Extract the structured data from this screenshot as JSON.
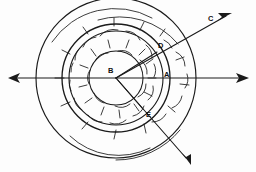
{
  "figure": {
    "background_color": "#fdfdfd",
    "ink_color": "#1a1a1a",
    "width": 256,
    "height": 172,
    "center": {
      "name": "B",
      "x": 116,
      "y": 78
    },
    "labels": [
      {
        "id": "B",
        "text": "B",
        "x": 110,
        "y": 73,
        "role": "center-of-circles"
      },
      {
        "id": "A",
        "text": "A",
        "x": 166,
        "y": 76,
        "role": "point-on-circle-right"
      },
      {
        "id": "C",
        "text": "C",
        "x": 209,
        "y": 20,
        "role": "ray-endpoint-upper-right"
      },
      {
        "id": "D",
        "text": "D",
        "x": 160,
        "y": 47,
        "role": "point-on-circle-upper-right"
      },
      {
        "id": "E",
        "text": "E",
        "x": 148,
        "y": 114,
        "role": "point-on-circle-lower-right"
      }
    ],
    "circles": [
      {
        "id": "outer",
        "cx": 116,
        "cy": 78,
        "r": 80,
        "class": "circle-outer"
      },
      {
        "id": "mid",
        "cx": 116,
        "cy": 78,
        "r": 54,
        "class": "circle-mid"
      },
      {
        "id": "inner",
        "cx": 116,
        "cy": 78,
        "r": 47,
        "class": "circle-inner"
      },
      {
        "id": "small",
        "cx": 116,
        "cy": 78,
        "r": 27,
        "class": "circle-small"
      }
    ],
    "rays": [
      {
        "id": "axis-left",
        "x1": 116,
        "y1": 78,
        "x2": 10,
        "y2": 78,
        "arrow": true,
        "label": ""
      },
      {
        "id": "axis-right",
        "x1": 116,
        "y1": 78,
        "x2": 246,
        "y2": 78,
        "arrow": true,
        "label": ""
      },
      {
        "id": "ray-to-C",
        "x1": 116,
        "y1": 78,
        "x2": 228,
        "y2": 15,
        "arrow": true,
        "label": "C"
      },
      {
        "id": "ray-lower",
        "x1": 116,
        "y1": 78,
        "x2": 190,
        "y2": 163,
        "arrow": true,
        "label": ""
      },
      {
        "id": "chord-BD",
        "x1": 116,
        "y1": 78,
        "x2": 157,
        "y2": 52,
        "arrow": false,
        "label": "D"
      },
      {
        "id": "chord-BE",
        "x1": 116,
        "y1": 78,
        "x2": 143,
        "y2": 109,
        "arrow": false,
        "label": "E"
      }
    ],
    "annotation": {
      "hatch_style": "short-curved-tick-arcs",
      "hatch_count": 34,
      "description": "concentric circular arcs with curved hatch ticks between radii"
    }
  }
}
